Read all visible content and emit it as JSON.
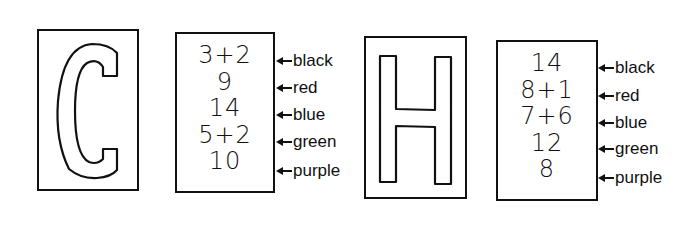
{
  "puzzles": [
    {
      "letter": "C",
      "numbers": [
        "3+2",
        "9",
        "14",
        "5+2",
        "10"
      ],
      "labels": [
        "black",
        "red",
        "blue",
        "green",
        "purple"
      ]
    },
    {
      "letter": "H",
      "numbers": [
        "14",
        "8+1",
        "7+6",
        "12",
        "8"
      ],
      "labels": [
        "black",
        "red",
        "blue",
        "green",
        "purple"
      ]
    }
  ]
}
